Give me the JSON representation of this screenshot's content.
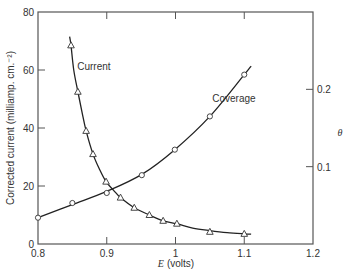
{
  "chart_data": {
    "type": "line",
    "title": "",
    "xlabel": "E (volts)",
    "xlabel_var": "E",
    "xlabel_unit": "(volts)",
    "ylabel": "Corrected current (milliamp. cm.⁻²)",
    "ylabel_right": "θ",
    "xlim": [
      0.8,
      1.2
    ],
    "ylim": [
      0,
      80
    ],
    "ylim_right": [
      0,
      0.3
    ],
    "x_ticks": [
      "0.8",
      "0.9",
      "1",
      "1.1",
      "1.2"
    ],
    "y_ticks": [
      "0",
      "20",
      "40",
      "60",
      "80"
    ],
    "y_right_ticks": [
      "0.1",
      "0.2"
    ],
    "grid": false,
    "legend": "inline labels",
    "series": [
      {
        "name": "Current",
        "axis": "left",
        "marker": "triangle",
        "x": [
          0.848,
          0.858,
          0.87,
          0.88,
          0.899,
          0.92,
          0.94,
          0.962,
          0.982,
          1.002,
          1.05,
          1.1
        ],
        "y": [
          68.5,
          52.5,
          39.0,
          31.0,
          21.5,
          16.0,
          12.5,
          10.0,
          8.0,
          7.0,
          4.2,
          3.5
        ],
        "curve_x": [
          0.846,
          0.848,
          0.852,
          0.858,
          0.864,
          0.87,
          0.88,
          0.89,
          0.899,
          0.91,
          0.92,
          0.94,
          0.962,
          0.982,
          1.002,
          1.025,
          1.05,
          1.075,
          1.1,
          1.11
        ],
        "curve_y": [
          71.5,
          68.5,
          60.0,
          52.5,
          45.5,
          39.0,
          31.0,
          25.5,
          21.5,
          18.5,
          16.0,
          12.5,
          10.0,
          8.0,
          7.0,
          5.5,
          4.6,
          3.9,
          3.5,
          3.4
        ]
      },
      {
        "name": "Coverage",
        "axis": "right",
        "marker": "circle",
        "x": [
          0.8,
          0.85,
          0.9,
          0.951,
          0.999,
          1.05,
          1.1
        ],
        "y": [
          0.034,
          0.053,
          0.066,
          0.089,
          0.122,
          0.165,
          0.219
        ],
        "curve_x": [
          0.8,
          0.85,
          0.9,
          0.951,
          0.999,
          1.05,
          1.1,
          1.11
        ],
        "curve_y": [
          0.034,
          0.051,
          0.068,
          0.09,
          0.122,
          0.165,
          0.219,
          0.23
        ]
      }
    ],
    "annotations": [
      {
        "text": "Current",
        "x": 0.857,
        "y": 60
      },
      {
        "text": "Coverage",
        "x": 1.085,
        "y_right": 0.183
      }
    ]
  }
}
